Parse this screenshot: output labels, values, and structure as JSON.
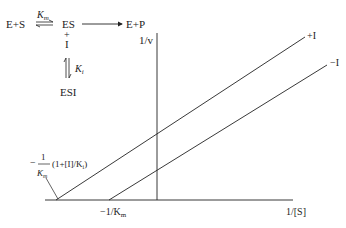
{
  "scheme": {
    "reactants": "E+S",
    "km_label": "K",
    "km_sub": "m",
    "complex": "ES",
    "plus": "+",
    "inhibitor": "I",
    "products": "E+P",
    "ki_label": "K",
    "ki_sub": "i",
    "esi": "ESI"
  },
  "plot": {
    "y_axis_label": "1/v",
    "x_axis_label": "1/[S]",
    "line_with_inhibitor": "+I",
    "line_without_inhibitor": "−I",
    "x_intercept_without": "−1/K",
    "x_intercept_without_sub": "m",
    "x_intercept_with_num": "1",
    "x_intercept_with_minus": "−",
    "x_intercept_with_den": "K",
    "x_intercept_with_den_sub": "m",
    "x_intercept_with_factor": "(1+[I]/K",
    "x_intercept_with_factor_sub": "i",
    "x_intercept_with_close": ")"
  }
}
